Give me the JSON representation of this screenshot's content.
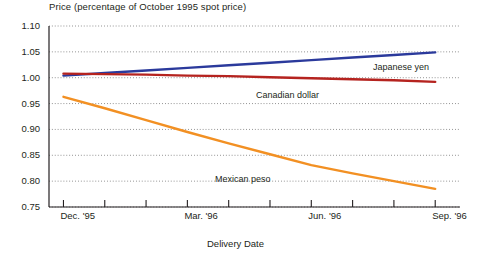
{
  "chart_data": {
    "type": "line",
    "title": "Price (percentage of October 1995 spot price)",
    "xlabel": "Delivery Date",
    "ylabel": "",
    "ylim": [
      0.75,
      1.1
    ],
    "ytick_labels": [
      "1.10",
      "1.05",
      "1.00",
      "0.95",
      "0.90",
      "0.85",
      "0.80",
      "0.75"
    ],
    "ytick_values": [
      1.1,
      1.05,
      1.0,
      0.95,
      0.9,
      0.85,
      0.8,
      0.75
    ],
    "xtick_labels": [
      "Dec. '95",
      "Mar. '96",
      "Jun. '96",
      "Sep. '96"
    ],
    "xtick_values": [
      0,
      3,
      6,
      9
    ],
    "xlim": [
      -0.35,
      9.6
    ],
    "x_minor_ticks": [
      0,
      1,
      2,
      3,
      4,
      5,
      6,
      7,
      8,
      9,
      10,
      11,
      12,
      13,
      14,
      15
    ],
    "grid": true,
    "legend": "inline-labels",
    "series": [
      {
        "name": "Japanese yen",
        "color": "#2b3a9c",
        "label_x": 373,
        "label_y": 62,
        "x": [
          0,
          1,
          2,
          3,
          4,
          5,
          6,
          7,
          8,
          9
        ],
        "values": [
          1.004,
          1.009,
          1.014,
          1.019,
          1.024,
          1.029,
          1.034,
          1.039,
          1.044,
          1.049
        ]
      },
      {
        "name": "Canadian dollar",
        "color": "#b5231f",
        "label_x": 256,
        "label_y": 90,
        "x": [
          0,
          1,
          2,
          3,
          4,
          5,
          6,
          7,
          8,
          9
        ],
        "values": [
          1.008,
          1.007,
          1.006,
          1.004,
          1.003,
          1.001,
          0.999,
          0.997,
          0.995,
          0.992
        ]
      },
      {
        "name": "Mexican peso",
        "color": "#f29023",
        "label_x": 215,
        "label_y": 174,
        "x": [
          0,
          1,
          2,
          3,
          4,
          5,
          6,
          7,
          8,
          9
        ],
        "values": [
          0.963,
          0.941,
          0.918,
          0.895,
          0.873,
          0.852,
          0.831,
          0.815,
          0.8,
          0.785
        ]
      }
    ]
  }
}
